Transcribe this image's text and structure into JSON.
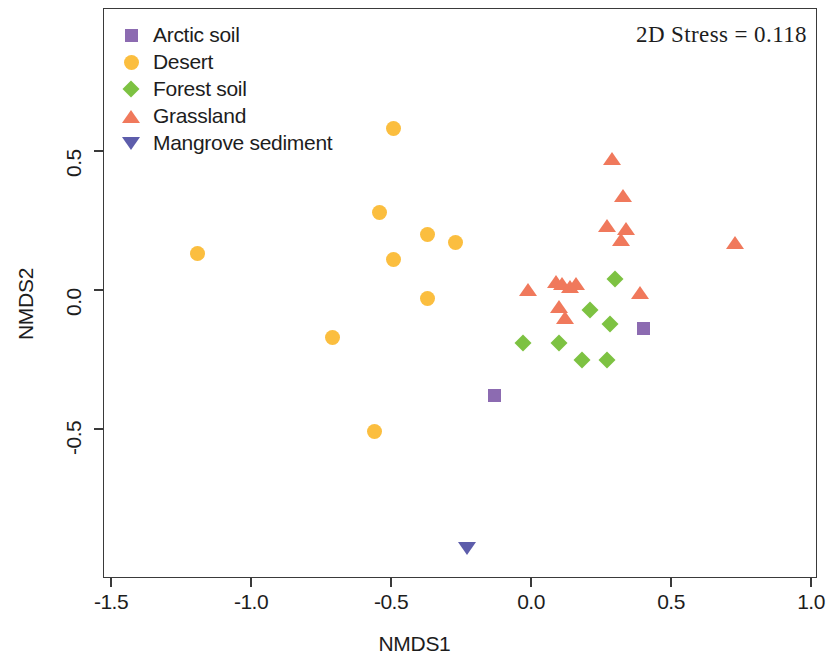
{
  "figure": {
    "stress_annotation": "2D Stress = 0.118",
    "xlabel": "NMDS1",
    "ylabel": "NMDS2"
  },
  "legend": {
    "items": [
      {
        "label": "Arctic soil",
        "marker": "square",
        "color": "#8C6BB1"
      },
      {
        "label": "Desert",
        "marker": "circle",
        "color": "#FBBE3F"
      },
      {
        "label": "Forest soil",
        "marker": "diamond",
        "color": "#7DC242"
      },
      {
        "label": "Grassland",
        "marker": "triangle",
        "color": "#F0795C"
      },
      {
        "label": "Mangrove sediment",
        "marker": "triangle-down",
        "color": "#5D5DAB"
      }
    ]
  },
  "chart_data": {
    "type": "scatter",
    "title": "",
    "subtitle": "",
    "xlabel": "NMDS1",
    "ylabel": "NMDS2",
    "xlim": [
      -1.53,
      1.02
    ],
    "ylim": [
      -1.02,
      0.62
    ],
    "xticks": [
      -1.5,
      -1.0,
      -0.5,
      0.0,
      0.5,
      1.0
    ],
    "xticklabels": [
      "-1.5",
      "-1.0",
      "-0.5",
      "0.0",
      "0.5",
      "1.0"
    ],
    "yticks": [
      0.5,
      0.0,
      -0.5
    ],
    "yticklabels": [
      "0.5",
      "0.0",
      "-0.5"
    ],
    "grid": false,
    "legend_position": "top-left",
    "annotations": [
      {
        "text": "2D Stress = 0.118",
        "x": 0.72,
        "y": 0.58
      }
    ],
    "series": [
      {
        "name": "Arctic soil",
        "marker": "square",
        "color": "#8C6BB1",
        "points": [
          {
            "x": -0.13,
            "y": -0.38
          },
          {
            "x": 0.4,
            "y": -0.14
          }
        ]
      },
      {
        "name": "Desert",
        "marker": "circle",
        "color": "#FBBE3F",
        "points": [
          {
            "x": -0.49,
            "y": 0.58
          },
          {
            "x": -1.19,
            "y": 0.13
          },
          {
            "x": -0.54,
            "y": 0.28
          },
          {
            "x": -0.37,
            "y": 0.2
          },
          {
            "x": -0.27,
            "y": 0.17
          },
          {
            "x": -0.49,
            "y": 0.11
          },
          {
            "x": -0.37,
            "y": -0.03
          },
          {
            "x": -0.71,
            "y": -0.17
          },
          {
            "x": -0.56,
            "y": -0.51
          }
        ]
      },
      {
        "name": "Forest soil",
        "marker": "diamond",
        "color": "#7DC242",
        "points": [
          {
            "x": 0.31,
            "y": 0.03
          },
          {
            "x": 0.22,
            "y": -0.08
          },
          {
            "x": 0.29,
            "y": -0.13
          },
          {
            "x": 0.11,
            "y": -0.2
          },
          {
            "x": -0.02,
            "y": -0.2
          },
          {
            "x": 0.19,
            "y": -0.26
          },
          {
            "x": 0.28,
            "y": -0.26
          }
        ]
      },
      {
        "name": "Grassland",
        "marker": "triangle",
        "color": "#F0795C",
        "points": [
          {
            "x": 0.29,
            "y": 0.47
          },
          {
            "x": 0.33,
            "y": 0.34
          },
          {
            "x": 0.27,
            "y": 0.23
          },
          {
            "x": 0.34,
            "y": 0.22
          },
          {
            "x": 0.32,
            "y": 0.18
          },
          {
            "x": 0.73,
            "y": 0.17
          },
          {
            "x": -0.01,
            "y": 0.0
          },
          {
            "x": 0.09,
            "y": 0.03
          },
          {
            "x": 0.11,
            "y": 0.02
          },
          {
            "x": 0.16,
            "y": 0.02
          },
          {
            "x": 0.14,
            "y": 0.01
          },
          {
            "x": 0.39,
            "y": -0.01
          },
          {
            "x": 0.1,
            "y": -0.06
          },
          {
            "x": 0.12,
            "y": -0.1
          }
        ]
      },
      {
        "name": "Mangrove sediment",
        "marker": "triangle-down",
        "color": "#5D5DAB",
        "points": [
          {
            "x": -0.23,
            "y": -0.93
          }
        ]
      }
    ]
  }
}
